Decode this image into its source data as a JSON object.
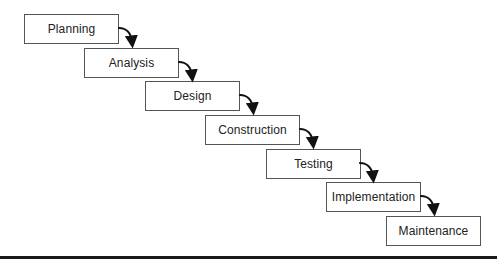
{
  "diagram": {
    "type": "waterfall",
    "stages": [
      {
        "label": "Planning"
      },
      {
        "label": "Analysis"
      },
      {
        "label": "Design"
      },
      {
        "label": "Construction"
      },
      {
        "label": "Testing"
      },
      {
        "label": "Implementation"
      },
      {
        "label": "Maintenance"
      }
    ],
    "colors": {
      "box_border": "#555555",
      "text": "#222222",
      "arrow": "#111111",
      "baseline": "#1a1a1a"
    }
  }
}
